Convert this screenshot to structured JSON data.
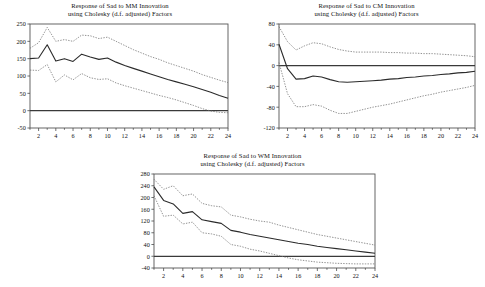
{
  "figure": {
    "name": "impulse-response-figure",
    "background": "#ffffff",
    "line_color": "#2b2b2b",
    "band_color": "#6e6e6e",
    "axis_color": "#4d4d4d",
    "frame_color": "#555555"
  },
  "panels": [
    {
      "id": "mm",
      "title_line1": "Response of Sad to MM Innovation",
      "title_line2": "using Cholesky (d.f. adjusted) Factors"
    },
    {
      "id": "cm",
      "title_line1": "Response of Sad to CM Innovation",
      "title_line2": "using Cholesky (d.f. adjusted) Factors"
    },
    {
      "id": "wm",
      "title_line1": "Response of Sad to WM Innovation",
      "title_line2": "using Cholesky (d.f. adjusted) Factors"
    }
  ],
  "chart_data": [
    {
      "type": "line",
      "id": "mm",
      "title": "Response of Sad to MM Innovation using Cholesky (d.f. adjusted) Factors",
      "xlabel": "",
      "ylabel": "",
      "x": [
        1,
        2,
        3,
        4,
        5,
        6,
        7,
        8,
        9,
        10,
        11,
        12,
        13,
        14,
        15,
        16,
        17,
        18,
        19,
        20,
        21,
        22,
        23,
        24
      ],
      "xlim": [
        1,
        24
      ],
      "ylim": [
        -50,
        250
      ],
      "xticks": [
        2,
        4,
        6,
        8,
        10,
        12,
        14,
        16,
        18,
        20,
        22,
        24
      ],
      "yticks": [
        -50,
        0,
        50,
        100,
        150,
        200,
        250
      ],
      "grid": false,
      "legend": "none",
      "zero_line": 0,
      "series": [
        {
          "name": "upper confidence band",
          "style": "dotted",
          "values": [
            180,
            196,
            240,
            200,
            205,
            200,
            218,
            216,
            208,
            212,
            200,
            188,
            176,
            166,
            156,
            148,
            138,
            130,
            122,
            114,
            104,
            96,
            88,
            81
          ]
        },
        {
          "name": "response",
          "style": "solid",
          "values": [
            150,
            152,
            190,
            143,
            150,
            142,
            163,
            155,
            148,
            152,
            140,
            130,
            122,
            114,
            106,
            98,
            90,
            83,
            76,
            69,
            61,
            53,
            44,
            36
          ]
        },
        {
          "name": "lower confidence band",
          "style": "dotted",
          "values": [
            117,
            116,
            133,
            83,
            103,
            89,
            107,
            95,
            90,
            92,
            80,
            72,
            65,
            58,
            51,
            44,
            38,
            31,
            23,
            15,
            6,
            -1,
            -5,
            -6
          ]
        }
      ]
    },
    {
      "type": "line",
      "id": "cm",
      "title": "Response of Sad to CM Innovation using Cholesky (d.f. adjusted) Factors",
      "xlabel": "",
      "ylabel": "",
      "x": [
        1,
        2,
        3,
        4,
        5,
        6,
        7,
        8,
        9,
        10,
        11,
        12,
        13,
        14,
        15,
        16,
        17,
        18,
        19,
        20,
        21,
        22,
        23,
        24
      ],
      "xlim": [
        1,
        24
      ],
      "ylim": [
        -120,
        80
      ],
      "xticks": [
        2,
        4,
        6,
        8,
        10,
        12,
        14,
        16,
        18,
        20,
        22,
        24
      ],
      "yticks": [
        -120,
        -80,
        -40,
        0,
        40,
        80
      ],
      "grid": false,
      "legend": "none",
      "zero_line": 0,
      "series": [
        {
          "name": "upper confidence band",
          "style": "dotted",
          "values": [
            75,
            46,
            30,
            38,
            44,
            42,
            36,
            31,
            28,
            26,
            26,
            26,
            26,
            25,
            25,
            24,
            24,
            23,
            23,
            22,
            21,
            20,
            19,
            17
          ]
        },
        {
          "name": "response",
          "style": "solid",
          "values": [
            41,
            -6,
            -26,
            -25,
            -20,
            -22,
            -27,
            -31,
            -32,
            -31,
            -30,
            -29,
            -28,
            -26,
            -25,
            -23,
            -22,
            -20,
            -19,
            -17,
            -16,
            -14,
            -13,
            -11
          ]
        },
        {
          "name": "lower confidence band",
          "style": "dotted",
          "values": [
            6,
            -54,
            -79,
            -79,
            -75,
            -78,
            -86,
            -92,
            -92,
            -88,
            -84,
            -80,
            -77,
            -74,
            -70,
            -66,
            -62,
            -58,
            -55,
            -51,
            -48,
            -45,
            -42,
            -38
          ]
        }
      ]
    },
    {
      "type": "line",
      "id": "wm",
      "title": "Response of Sad to WM Innovation using Cholesky (d.f. adjusted) Factors",
      "xlabel": "",
      "ylabel": "",
      "x": [
        1,
        2,
        3,
        4,
        5,
        6,
        7,
        8,
        9,
        10,
        11,
        12,
        13,
        14,
        15,
        16,
        17,
        18,
        19,
        20,
        21,
        22,
        23,
        24
      ],
      "xlim": [
        1,
        24
      ],
      "ylim": [
        -40,
        280
      ],
      "xticks": [
        2,
        4,
        6,
        8,
        10,
        12,
        14,
        16,
        18,
        20,
        22,
        24
      ],
      "yticks": [
        -40,
        0,
        40,
        80,
        120,
        160,
        200,
        240,
        280
      ],
      "grid": false,
      "legend": "none",
      "zero_line": 0,
      "series": [
        {
          "name": "upper confidence band",
          "style": "dotted",
          "values": [
            262,
            228,
            240,
            206,
            212,
            180,
            172,
            168,
            140,
            134,
            126,
            120,
            116,
            106,
            98,
            90,
            82,
            74,
            68,
            62,
            56,
            50,
            44,
            38
          ]
        },
        {
          "name": "response",
          "style": "solid",
          "values": [
            236,
            190,
            178,
            146,
            152,
            124,
            118,
            112,
            88,
            82,
            74,
            68,
            62,
            56,
            50,
            44,
            40,
            34,
            30,
            26,
            22,
            18,
            14,
            10
          ]
        },
        {
          "name": "lower confidence band",
          "style": "dotted",
          "values": [
            206,
            136,
            140,
            110,
            116,
            80,
            76,
            68,
            40,
            34,
            24,
            18,
            10,
            2,
            -6,
            -12,
            -16,
            -20,
            -22,
            -24,
            -25,
            -26,
            -26,
            -26
          ]
        }
      ]
    }
  ]
}
